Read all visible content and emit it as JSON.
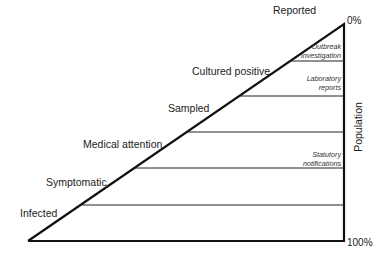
{
  "diagram": {
    "type": "surveillance-pyramid",
    "levels": [
      {
        "label": "Reported"
      },
      {
        "label": "Cultured positive"
      },
      {
        "label": "Sampled"
      },
      {
        "label": "Medical attention"
      },
      {
        "label": "Symptomatic"
      },
      {
        "label": "Infected"
      }
    ],
    "sources": [
      {
        "label": "Outbreak investigation",
        "line1": "Outbreak",
        "line2": "investigation"
      },
      {
        "label": "Laboratory reports",
        "line1": "Laboratory",
        "line2": "reports"
      },
      {
        "label": "Statutory notifications",
        "line1": "Statutory",
        "line2": "notifications"
      }
    ],
    "axis": {
      "label": "Population",
      "top": "0%",
      "bottom": "100%"
    },
    "colors": {
      "line": "#111111",
      "background": "#ffffff"
    }
  }
}
